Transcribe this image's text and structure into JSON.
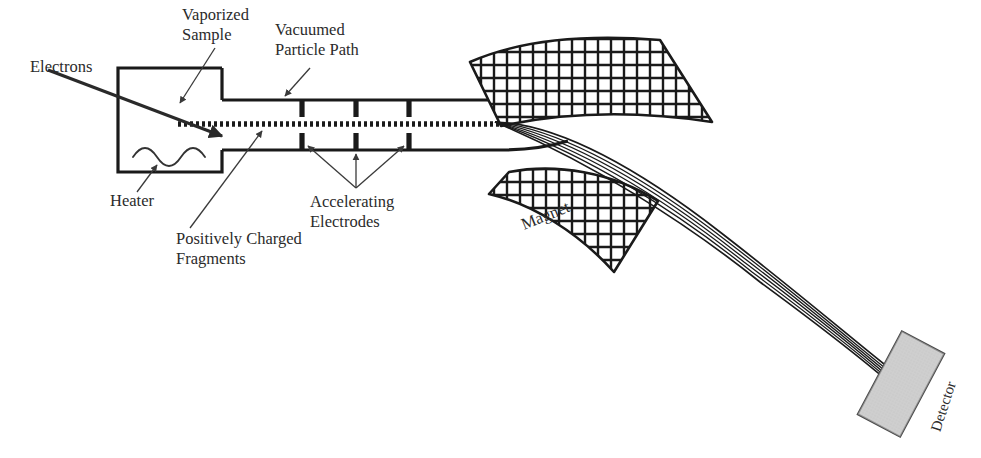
{
  "diagram": {
    "background_color": "#ffffff",
    "ink_color": "#1a1a1a",
    "text_color": "#2b2b2b",
    "detector_fill": "#c9c9c9",
    "labels": {
      "electrons": "Electrons",
      "vaporized_sample_line1": "Vaporized",
      "vaporized_sample_line2": "Sample",
      "vacuumed_path_line1": "Vacuumed",
      "vacuumed_path_line2": "Particle Path",
      "heater": "Heater",
      "positively_charged_line1": "Positively Charged",
      "positively_charged_line2": "Fragments",
      "accelerating_line1": "Accelerating",
      "accelerating_line2": "Electrodes",
      "magnet": "Magnet",
      "detector": "Detector"
    },
    "components": {
      "ionization_chamber": {
        "name": "ionization-chamber",
        "x": 118,
        "y": 68,
        "width": 104,
        "height": 104
      },
      "heater_coil": {
        "name": "heater-coil",
        "waves": 3,
        "x": 133,
        "y": 150,
        "width": 74,
        "amplitude": 9
      },
      "flight_tube": {
        "name": "flight-tube",
        "top_y": 100,
        "bottom_y": 150,
        "x_start": 222,
        "x_end": 500
      },
      "particle_beam_dotted": {
        "name": "dotted-beam",
        "y": 124,
        "x_start": 178,
        "x_end": 500,
        "dash": "3 3"
      },
      "electrodes": {
        "name": "accelerating-electrodes",
        "count": 3,
        "x_positions": [
          302,
          356,
          409
        ],
        "height": 18
      },
      "magnet_upper": {
        "name": "magnet-pole-upper",
        "hatch": "crosshatch"
      },
      "magnet_lower": {
        "name": "magnet-pole-lower",
        "hatch": "crosshatch"
      },
      "ion_beams": {
        "name": "ion-beam-trajectories",
        "count": 6,
        "origin_x": 495,
        "origin_y": 122
      },
      "detector": {
        "name": "detector-plate",
        "x": 878,
        "y": 338,
        "width": 46,
        "height": 92,
        "rotation_deg": 28
      }
    }
  }
}
